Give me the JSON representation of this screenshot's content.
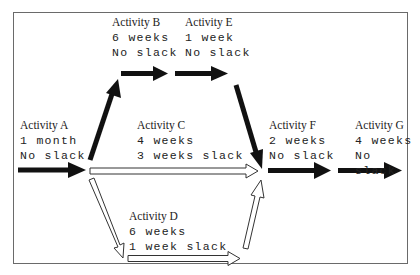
{
  "diagram": {
    "type": "activity-network",
    "critical_color": "#111111",
    "slack_color": "#ffffff",
    "activities": {
      "A": {
        "title": "Activity A",
        "duration": "1 month",
        "slack": "No slack"
      },
      "B": {
        "title": "Activity B",
        "duration": "6 weeks",
        "slack": "No slack"
      },
      "C": {
        "title": "Activity C",
        "duration": "4 weeks",
        "slack": "3 weeks slack"
      },
      "D": {
        "title": "Activity D",
        "duration": "6 weeks",
        "slack": "1 week slack"
      },
      "E": {
        "title": "Activity E",
        "duration": "1 week",
        "slack": "No slack"
      },
      "F": {
        "title": "Activity F",
        "duration": "2 weeks",
        "slack": "No slack"
      },
      "G": {
        "title": "Activity G",
        "duration": "4 weeks",
        "slack": "No slack"
      }
    },
    "edges": [
      {
        "from": "start",
        "to": "A",
        "critical": true
      },
      {
        "from": "A",
        "to": "B",
        "critical": true
      },
      {
        "from": "B",
        "to": "E",
        "critical": true
      },
      {
        "from": "E",
        "to": "F",
        "critical": true
      },
      {
        "from": "A",
        "to": "C",
        "critical": false
      },
      {
        "from": "C",
        "to": "F",
        "critical": false
      },
      {
        "from": "A",
        "to": "D",
        "critical": false
      },
      {
        "from": "D",
        "to": "F",
        "critical": false
      },
      {
        "from": "F",
        "to": "G",
        "critical": true
      }
    ]
  }
}
